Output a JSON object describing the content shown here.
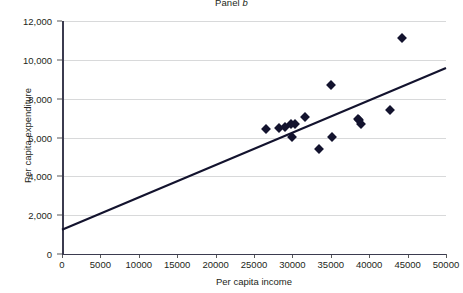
{
  "chart_data": {
    "type": "scatter",
    "title": "Panel b",
    "title_plain": "Panel",
    "title_italic": "b",
    "xlabel": "Per capita income",
    "ylabel": "Per capita expenditure",
    "xlim": [
      0,
      50000
    ],
    "ylim": [
      0,
      12000
    ],
    "xticks": [
      0,
      5000,
      10000,
      15000,
      20000,
      25000,
      30000,
      35000,
      40000,
      45000,
      50000
    ],
    "xtick_labels": [
      "0",
      "5000",
      "10000",
      "15000",
      "20000",
      "25000",
      "30000",
      "35000",
      "40000",
      "45000",
      "50000"
    ],
    "yticks": [
      0,
      2000,
      4000,
      6000,
      8000,
      10000,
      12000
    ],
    "ytick_labels": [
      "0",
      "2,000",
      "4,000",
      "6,000",
      "8,000",
      "10,000",
      "12,000"
    ],
    "grid": "horizontal",
    "legend": "none",
    "marker": "diamond",
    "marker_color": "#13132e",
    "line_color": "#13132e",
    "grid_color": "#d8d9da",
    "axis_color": "#3b3b4f",
    "background": "#ffffff",
    "points": [
      {
        "x": 26600,
        "y": 6450
      },
      {
        "x": 28200,
        "y": 6480
      },
      {
        "x": 29100,
        "y": 6560
      },
      {
        "x": 29800,
        "y": 6680
      },
      {
        "x": 30000,
        "y": 6050
      },
      {
        "x": 30400,
        "y": 6700
      },
      {
        "x": 31600,
        "y": 7070
      },
      {
        "x": 33400,
        "y": 5400
      },
      {
        "x": 35000,
        "y": 8720
      },
      {
        "x": 35200,
        "y": 6050
      },
      {
        "x": 38500,
        "y": 6970
      },
      {
        "x": 38700,
        "y": 6900
      },
      {
        "x": 38900,
        "y": 6700
      },
      {
        "x": 42700,
        "y": 7420
      },
      {
        "x": 44300,
        "y": 11120
      }
    ],
    "trendline": {
      "x_start": 0,
      "y_start": 1250,
      "x_end": 50000,
      "y_end": 9580
    }
  }
}
